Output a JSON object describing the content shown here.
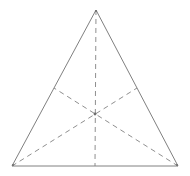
{
  "figure": {
    "name": "triangle-with-medians",
    "background_color": "#ffffff",
    "width": 190,
    "height": 176,
    "solid_stroke_color": "#808080",
    "dashed_stroke_color": "#8f8f8f",
    "stroke_width": 1,
    "dash_pattern": "5 4",
    "labels": []
  },
  "chart_data": {
    "type": "diagram",
    "title": "",
    "shape": "triangle",
    "vertices": [
      {
        "id": "apex",
        "label": "",
        "x": 96,
        "y": 10
      },
      {
        "id": "bottom-left",
        "label": "",
        "x": 12,
        "y": 166
      },
      {
        "id": "bottom-right",
        "label": "",
        "x": 178,
        "y": 166
      }
    ],
    "edges": [
      {
        "id": "left-side",
        "from": "apex",
        "to": "bottom-left",
        "style": "solid"
      },
      {
        "id": "right-side",
        "from": "apex",
        "to": "bottom-right",
        "style": "solid"
      },
      {
        "id": "base",
        "from": "bottom-left",
        "to": "bottom-right",
        "style": "solid"
      }
    ],
    "midpoints": [
      {
        "id": "midpoint-left-side",
        "on_edge": "left-side",
        "x": 54,
        "y": 88
      },
      {
        "id": "midpoint-right-side",
        "on_edge": "right-side",
        "x": 137,
        "y": 88
      },
      {
        "id": "midpoint-base",
        "on_edge": "base",
        "x": 95,
        "y": 166
      }
    ],
    "medians": [
      {
        "id": "median-from-apex",
        "from": "apex",
        "to": "midpoint-base",
        "style": "dashed"
      },
      {
        "id": "median-from-bottom-left",
        "from": "bottom-left",
        "to": "midpoint-right-side",
        "style": "dashed"
      },
      {
        "id": "median-from-bottom-right",
        "from": "bottom-right",
        "to": "midpoint-left-side",
        "style": "dashed"
      }
    ],
    "centroid": {
      "id": "centroid",
      "label": "",
      "x": 95,
      "y": 114
    }
  }
}
